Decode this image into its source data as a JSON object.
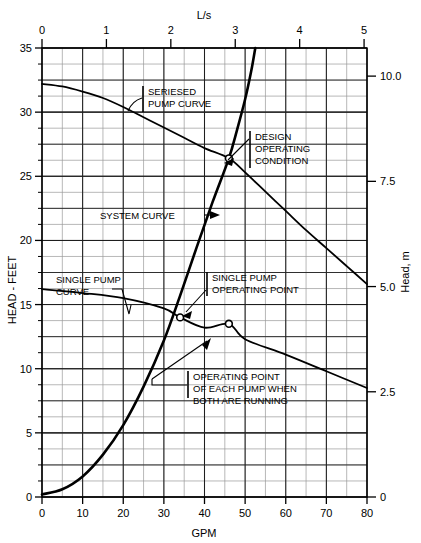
{
  "chart_data": {
    "type": "line",
    "title": "",
    "xlabel": "GPM",
    "ylabel": "HEAD - FEET",
    "secondary_xlabel": "L/s",
    "secondary_ylabel": "Head, m",
    "xlim": [
      0,
      80
    ],
    "ylim": [
      0,
      35
    ],
    "secondary_xlim": [
      0,
      5.0454
    ],
    "secondary_ylim": [
      0,
      10.668
    ],
    "grid": true,
    "legend": "none",
    "x_ticks": [
      0,
      10,
      20,
      30,
      40,
      50,
      60,
      70,
      80
    ],
    "x_tick_labels": [
      "0",
      "10",
      "20",
      "30",
      "40",
      "50",
      "60",
      "70",
      "80"
    ],
    "y_ticks": [
      0,
      5,
      10,
      15,
      20,
      25,
      30,
      35
    ],
    "y_tick_labels": [
      "0",
      "5",
      "10",
      "15",
      "20",
      "25",
      "30",
      "35"
    ],
    "top_ticks": [
      0,
      1,
      2,
      3,
      4,
      5
    ],
    "top_tick_labels": [
      "0",
      "1",
      "2",
      "3",
      "4",
      "5"
    ],
    "right_ticks": [
      0,
      2.5,
      5.0,
      7.5,
      10.0
    ],
    "right_tick_labels": [
      "0",
      "2.5",
      "5.0",
      "7.5",
      "10.0"
    ],
    "minor_grid_x_step": 5,
    "minor_grid_y_step": 1.25,
    "series": [
      {
        "name": "SERIESED PUMP CURVE",
        "points": [
          [
            0,
            32.2
          ],
          [
            5,
            32.0
          ],
          [
            10,
            31.6
          ],
          [
            15,
            31.1
          ],
          [
            20,
            30.4
          ],
          [
            25,
            29.6
          ],
          [
            30,
            28.8
          ],
          [
            35,
            28.0
          ],
          [
            40,
            27.2
          ],
          [
            46,
            26.4
          ],
          [
            50,
            25.3
          ],
          [
            55,
            23.8
          ],
          [
            60,
            22.3
          ],
          [
            65,
            20.8
          ],
          [
            70,
            19.4
          ],
          [
            75,
            18.0
          ],
          [
            80,
            16.6
          ]
        ]
      },
      {
        "name": "SINGLE PUMP CURVE",
        "points": [
          [
            0,
            16.2
          ],
          [
            10,
            15.9
          ],
          [
            20,
            15.5
          ],
          [
            30,
            14.7
          ],
          [
            34,
            14.0
          ],
          [
            40,
            13.2
          ],
          [
            46,
            13.5
          ],
          [
            50,
            12.3
          ],
          [
            60,
            11.1
          ],
          [
            70,
            9.8
          ],
          [
            80,
            8.5
          ]
        ]
      },
      {
        "name": "SYSTEM CURVE",
        "points": [
          [
            0,
            0.2
          ],
          [
            5,
            0.6
          ],
          [
            10,
            1.6
          ],
          [
            15,
            3.3
          ],
          [
            20,
            5.6
          ],
          [
            25,
            8.6
          ],
          [
            30,
            12.2
          ],
          [
            34,
            15.7
          ],
          [
            38,
            19.4
          ],
          [
            42,
            23.0
          ],
          [
            46,
            26.4
          ],
          [
            48,
            28.6
          ],
          [
            50,
            31.0
          ],
          [
            51.5,
            33.2
          ],
          [
            52.5,
            35
          ]
        ]
      }
    ],
    "markers": [
      {
        "name": "design-operating-condition",
        "x": 46,
        "y": 26.4,
        "style": "open-circle"
      },
      {
        "name": "single-pump-operating-point",
        "x": 34,
        "y": 14.0,
        "style": "open-circle"
      },
      {
        "name": "operating-point-each-pump-both-running",
        "x": 46,
        "y": 13.5,
        "style": "open-circle"
      }
    ],
    "annotations": [
      {
        "id": "seriesed",
        "lines": [
          "SERIESED",
          "PUMP CURVE"
        ]
      },
      {
        "id": "design",
        "lines": [
          "DESIGN",
          "OPERATING",
          "CONDITION"
        ]
      },
      {
        "id": "system",
        "lines": [
          "SYSTEM CURVE"
        ]
      },
      {
        "id": "single_curve",
        "lines": [
          "SINGLE PUMP",
          "CURVE"
        ]
      },
      {
        "id": "single_point",
        "lines": [
          "SINGLE PUMP",
          "OPERATING POINT"
        ]
      },
      {
        "id": "both_running",
        "lines": [
          "OPERATING POINT",
          "OF EACH PUMP WHEN",
          "BOTH ARE RUNNING"
        ]
      }
    ],
    "colors": {
      "curve": "#000000",
      "grid_major": "#1a1a1a",
      "grid_minor": "#8a8a8a",
      "axis": "#000000",
      "text": "#000000",
      "background": "#ffffff"
    }
  },
  "labels": {
    "top_axis": "L/s",
    "bottom_axis": "GPM",
    "left_axis": "HEAD - FEET",
    "right_axis": "Head, m",
    "top_tick_0": "0",
    "top_tick_1": "1",
    "top_tick_2": "2",
    "top_tick_3": "3",
    "top_tick_4": "4",
    "top_tick_5": "5",
    "x_tick_0": "0",
    "x_tick_1": "10",
    "x_tick_2": "20",
    "x_tick_3": "30",
    "x_tick_4": "40",
    "x_tick_5": "50",
    "x_tick_6": "60",
    "x_tick_7": "70",
    "x_tick_8": "80",
    "y_tick_0": "0",
    "y_tick_1": "5",
    "y_tick_2": "10",
    "y_tick_3": "15",
    "y_tick_4": "20",
    "y_tick_5": "25",
    "y_tick_6": "30",
    "y_tick_7": "35",
    "r_tick_0": "0",
    "r_tick_1": "2.5",
    "r_tick_2": "5.0",
    "r_tick_3": "7.5",
    "r_tick_4": "10.0"
  },
  "annotations": {
    "seriesed_l1": "SERIESED",
    "seriesed_l2": "PUMP CURVE",
    "design_l1": "DESIGN",
    "design_l2": "OPERATING",
    "design_l3": "CONDITION",
    "system_l1": "SYSTEM CURVE",
    "single_curve_l1": "SINGLE PUMP",
    "single_curve_l2": "CURVE",
    "single_point_l1": "SINGLE PUMP",
    "single_point_l2": "OPERATING POINT",
    "both_l1": "OPERATING POINT",
    "both_l2": "OF EACH PUMP WHEN",
    "both_l3": "BOTH ARE RUNNING"
  }
}
